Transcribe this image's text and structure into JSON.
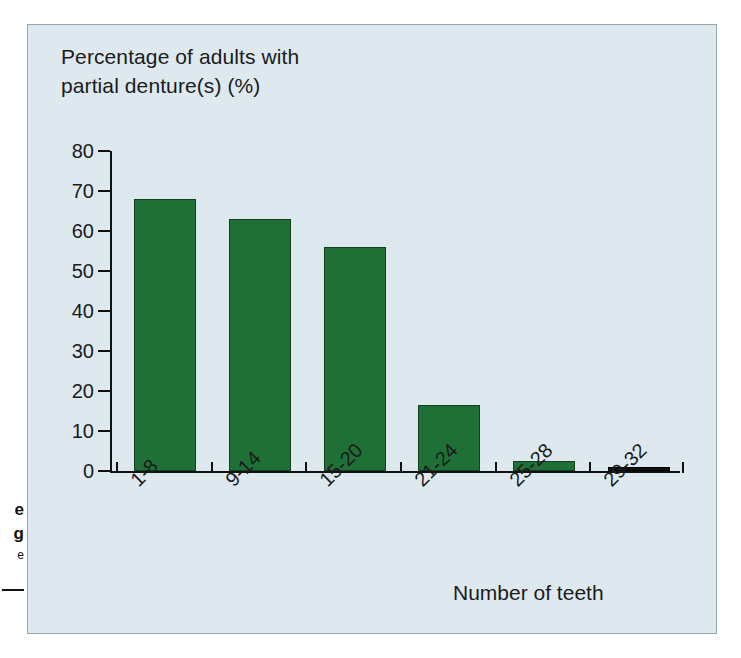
{
  "bleed": {
    "fragment_1": "e",
    "fragment_2": "g",
    "fragment_3": "e"
  },
  "chart_data": {
    "type": "bar",
    "title": "Percentage of adults with\npartial denture(s) (%)",
    "ylabel": "Percentage of adults with partial denture(s) (%)",
    "xlabel": "Number of teeth",
    "categories": [
      "1-8",
      "9-14",
      "15-20",
      "21-24",
      "25-28",
      "29-32"
    ],
    "values": [
      68,
      63,
      56,
      16.5,
      2.5,
      0.7
    ],
    "ylim": [
      0,
      80
    ],
    "yticks": [
      0,
      10,
      20,
      30,
      40,
      50,
      60,
      70,
      80
    ],
    "ytick_labels": [
      "0",
      "10",
      "20",
      "30",
      "40",
      "50",
      "60",
      "70",
      "80"
    ],
    "grid": false,
    "legend": false,
    "bar_color": "#1e7036",
    "bar_edge_color": "#123f20",
    "last_bar_color": "#111111",
    "background_color": "#dde9ef",
    "panel_border_color": "#9aa6ab",
    "text_color": "#1b1b1b",
    "xtick_label_rotation": -45
  }
}
